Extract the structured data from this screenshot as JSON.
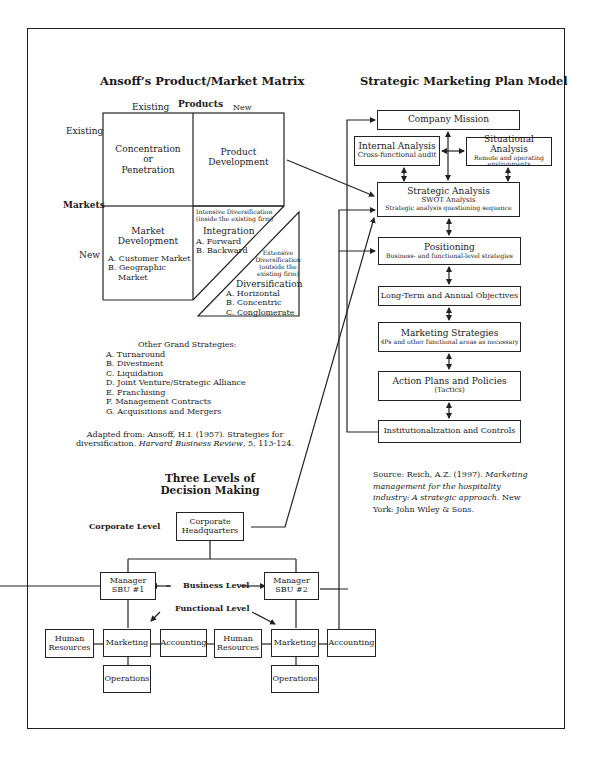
{
  "ansoff": {
    "title": "Ansoff’s Product/Market Matrix",
    "products_label": "Products",
    "markets_label": "Markets",
    "col_existing": "Existing",
    "col_new": "New",
    "row_existing": "Existing",
    "row_new": "New",
    "cells": {
      "concentration": [
        "Concentration",
        "or",
        "Penetration"
      ],
      "product_development": [
        "Product",
        "Development"
      ],
      "market_development": {
        "title": [
          "Market",
          "Development"
        ],
        "items": [
          "A. Customer Market",
          "B. Geographic",
          "Market"
        ]
      },
      "intensive": {
        "note": [
          "Intensive Diversification",
          "(inside the existing firm)"
        ],
        "title": "Integration",
        "items": [
          "A. Forward",
          "B. Backward"
        ]
      },
      "extensive": {
        "note": [
          "Extensive",
          "Diversification",
          "(outside the",
          "existing firm)"
        ],
        "title": "Diversification",
        "items": [
          "A. Horizontal",
          "B. Concentric",
          "C. Conglomerate"
        ]
      }
    },
    "other_strategies": {
      "title": "Other Grand Strategies:",
      "items": [
        "A. Turnaround",
        "B. Divestment",
        "C. Liquidation",
        "D. Joint Venture/Strategic Alliance",
        "E. Franchising",
        "F. Management Contracts",
        "G. Acquisitions and Mergers"
      ]
    },
    "source": {
      "line1": "Adapted from: Ansoff, H.I. (1957). Strategies for",
      "line2_plain": "diversification. ",
      "line2_italic": "Harvard Business Review",
      "line2_tail": ", 5, 113-124."
    }
  },
  "smpm": {
    "title": "Strategic Marketing Plan Model",
    "company_mission": "Company Mission",
    "internal_analysis": {
      "title": "Internal Analysis",
      "sub": "Cross-functional audit"
    },
    "situational_analysis": {
      "title": "Situational Analysis",
      "sub1": "Remote and operating",
      "sub2": "environments"
    },
    "strategic_analysis": {
      "title": "Strategic Analysis",
      "sub1": "SWOT Analysis",
      "sub2": "Strategic analysis questioning sequence"
    },
    "positioning": {
      "title": "Positioning",
      "sub": "Business- and functional-level strategies"
    },
    "objectives": "Long-Term and Annual Objectives",
    "marketing_strategies": {
      "title": "Marketing Strategies",
      "sub": "4Ps and other functional areas as necessary"
    },
    "action_plans": {
      "title": "Action Plans and Policies",
      "sub": "(Tactics)"
    },
    "institutionalization": "Institutionalization and Controls",
    "source": {
      "l1_plain": "Source: Reich, A.Z. (1997). ",
      "l1_italic": "Marketing",
      "l2_italic": "management for the hospitality",
      "l3_italic": "industry: A strategic approach",
      "l3_tail": ". New",
      "l4": "York: John Wiley & Sons."
    }
  },
  "levels": {
    "title1": "Three Levels of",
    "title2": "Decision Making",
    "corporate_level": "Corporate Level",
    "business_level": "Business Level",
    "functional_level": "Functional Level",
    "hq": [
      "Corporate",
      "Headquarters"
    ],
    "sbu1": [
      "Manager",
      "SBU #1"
    ],
    "sbu2": [
      "Manager",
      "SBU #2"
    ],
    "human_resources": [
      "Human",
      "Resources"
    ],
    "marketing": "Marketing",
    "accounting": "Accounting",
    "operations": "Operations"
  }
}
